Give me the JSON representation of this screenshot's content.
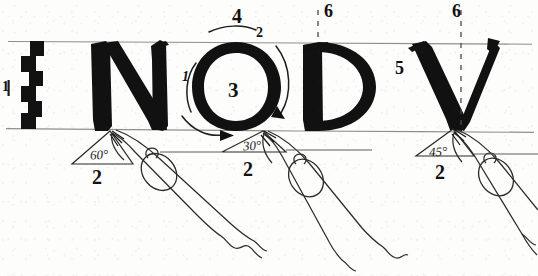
{
  "figure": {
    "medium": "pen-and-ink handwriting worksheet",
    "background_color": "#fdfdfc",
    "ink_color": "#111111",
    "guideline_color": "#8d8d8d",
    "letters": [
      {
        "glyph": "N",
        "order_labels": [],
        "pen_angle": "60°"
      },
      {
        "glyph": "O",
        "order_labels": [
          "1",
          "2",
          "3",
          "4"
        ],
        "pen_angle": "30°"
      },
      {
        "glyph": "D",
        "order_labels": [
          "6"
        ],
        "pen_angle": ""
      },
      {
        "glyph": "V",
        "order_labels": [
          "5",
          "6"
        ],
        "pen_angle": "45°"
      }
    ],
    "guidelines": {
      "cap_line_label": "cap-line",
      "base_line_label": "base-line"
    },
    "nib_ladder": {
      "label": "1",
      "steps": 5,
      "description": "stair-stepped nib-width height gauge"
    },
    "annotations": [
      {
        "id": "ladder-tick",
        "text": "1",
        "x": 4,
        "y": 84,
        "size": 13,
        "italic": false
      },
      {
        "id": "o-stroke-1",
        "text": "1",
        "x": 182,
        "y": 72,
        "size": 13,
        "italic": true
      },
      {
        "id": "o-stroke-2",
        "text": "2",
        "x": 256,
        "y": 28,
        "size": 13,
        "italic": false
      },
      {
        "id": "o-counter-3",
        "text": "3",
        "x": 228,
        "y": 82,
        "size": 20,
        "italic": false
      },
      {
        "id": "o-stroke-4",
        "text": "4",
        "x": 232,
        "y": 9,
        "size": 19,
        "italic": false
      },
      {
        "id": "v-stroke-5",
        "text": "5",
        "x": 395,
        "y": 61,
        "size": 17,
        "italic": false
      },
      {
        "id": "d-stem-6",
        "text": "6",
        "x": 325,
        "y": 4,
        "size": 17,
        "italic": false
      },
      {
        "id": "v-stem-6",
        "text": "6",
        "x": 452,
        "y": 4,
        "size": 17,
        "italic": false
      },
      {
        "id": "pen-label-left",
        "text": "2",
        "x": 93,
        "y": 170,
        "size": 19,
        "italic": false
      },
      {
        "id": "pen-label-middle",
        "text": "2",
        "x": 243,
        "y": 162,
        "size": 19,
        "italic": false
      },
      {
        "id": "pen-label-right",
        "text": "2",
        "x": 435,
        "y": 165,
        "size": 19,
        "italic": false
      }
    ],
    "angle_marks": [
      {
        "id": "angle-left",
        "text": "60°",
        "x": 92,
        "y": 151,
        "size": 12
      },
      {
        "id": "angle-middle",
        "text": "30°",
        "x": 245,
        "y": 142,
        "size": 12
      },
      {
        "id": "angle-right",
        "text": "45°",
        "x": 431,
        "y": 148,
        "size": 12
      }
    ],
    "pens": [
      {
        "id": "pen-left",
        "nib_at_x": 110,
        "nib_at_y": 131
      },
      {
        "id": "pen-middle",
        "nib_at_x": 262,
        "nib_at_y": 129
      },
      {
        "id": "pen-right",
        "nib_at_x": 452,
        "nib_at_y": 129
      }
    ]
  }
}
